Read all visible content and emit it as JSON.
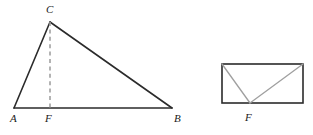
{
  "figure": {
    "canvas": {
      "width": 313,
      "height": 135,
      "background": "#ffffff"
    },
    "colors": {
      "stroke_solid": "#2b2b2b",
      "stroke_dashed": "#9a9a9a",
      "stroke_inner": "#a0a0a0",
      "label": "#1a1a1a"
    },
    "left_figure": {
      "name": "triangle-with-altitude",
      "points": {
        "A": {
          "x": 14,
          "y": 108
        },
        "B": {
          "x": 172,
          "y": 108
        },
        "C": {
          "x": 50,
          "y": 22
        },
        "F": {
          "x": 50,
          "y": 108
        }
      },
      "segments": [
        {
          "name": "side-AC",
          "from": "A",
          "to": "C",
          "style": "solid"
        },
        {
          "name": "side-CB",
          "from": "C",
          "to": "B",
          "style": "solid"
        },
        {
          "name": "base-AB",
          "from": "A",
          "to": "B",
          "style": "solid"
        },
        {
          "name": "altitude-CF",
          "from": "C",
          "to": "F",
          "style": "dashed"
        }
      ],
      "labels": {
        "A": "A",
        "B": "B",
        "C": "C",
        "F": "F"
      },
      "label_positions": {
        "A": {
          "x": 10,
          "y": 113
        },
        "B": {
          "x": 174,
          "y": 113
        },
        "C": {
          "x": 46,
          "y": 4
        },
        "F": {
          "x": 45,
          "y": 113
        }
      }
    },
    "right_figure": {
      "name": "rectangle-with-cevians",
      "rect": {
        "x": 222,
        "y": 64,
        "width": 81,
        "height": 39
      },
      "points": {
        "top_left": {
          "x": 222,
          "y": 64
        },
        "top_right": {
          "x": 303,
          "y": 64
        },
        "bottom_left": {
          "x": 222,
          "y": 103
        },
        "bottom_right": {
          "x": 303,
          "y": 103
        },
        "F": {
          "x": 250,
          "y": 103
        }
      },
      "segments": [
        {
          "name": "cevian-topleft-to-F",
          "from": "top_left",
          "to": "F",
          "style": "solid-gray"
        },
        {
          "name": "cevian-topright-to-F",
          "from": "top_right",
          "to": "F",
          "style": "solid-gray"
        }
      ],
      "labels": {
        "F": "F"
      },
      "label_positions": {
        "F": {
          "x": 245,
          "y": 112
        }
      }
    }
  }
}
